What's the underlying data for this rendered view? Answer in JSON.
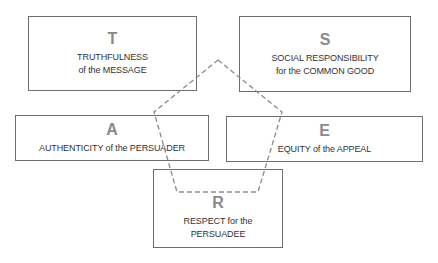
{
  "diagram": {
    "boxes": {
      "t": {
        "letter": "T",
        "line1": "TRUTHFULNESS",
        "line2": "of the MESSAGE"
      },
      "s": {
        "letter": "S",
        "line1": "SOCIAL RESPONSIBILITY",
        "line2": "for the COMMON GOOD"
      },
      "a": {
        "letter": "A",
        "line1": "AUTHENTICITY of the PERSUADER"
      },
      "e": {
        "letter": "E",
        "line1": "EQUITY of the APPEAL"
      },
      "r": {
        "letter": "R",
        "line1": "RESPECT for the",
        "line2": "PERSUADEE"
      }
    },
    "pentagon": {
      "style": "dashed",
      "color": "#8a8a8a",
      "points": "218,60 282,112 258,192 177,192 154,112"
    },
    "colors": {
      "border": "#6e6e6e",
      "letter": "#8a8a8a",
      "caption": "#333333"
    }
  }
}
